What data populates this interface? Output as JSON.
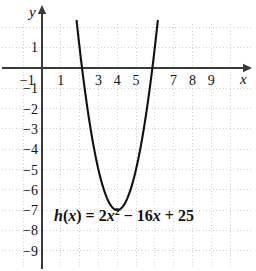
{
  "figure": {
    "background_color": "#ffffff",
    "axis_color": "#3a3a3a",
    "grid_color": "#d0d0d0",
    "curve_color": "#111111",
    "x_axis_letter": "x",
    "y_axis_letter": "y",
    "equation_parts": {
      "lhs_fn": "h",
      "lhs_open": "(",
      "lhs_var": "x",
      "lhs_close": ")",
      "equals": "=",
      "coef_a": "2",
      "var_a": "x",
      "exponent": "2",
      "minus": "−",
      "coef_b": "16",
      "var_b": "x",
      "plus": "+",
      "constant": "25"
    },
    "equation_text": "h(x) = 2x² − 16x + 25"
  },
  "chart_data": {
    "type": "line",
    "title": "",
    "subtitle": "",
    "xlabel": "x",
    "ylabel": "y",
    "annotations": [
      "h(x) = 2x² − 16x + 25"
    ],
    "function": "h(x) = 2x^2 - 16x + 25",
    "coefficients": {
      "a": 2,
      "b": -16,
      "c": 25
    },
    "vertex": {
      "x": 4,
      "y": -7
    },
    "roots": [
      2.129,
      5.871
    ],
    "y_intercept": 25,
    "grid": true,
    "legend": "none",
    "xlim": [
      -1.6,
      10.4
    ],
    "ylim": [
      -9.8,
      2.1
    ],
    "x_ticks": [
      -1,
      1,
      2,
      3,
      4,
      5,
      6,
      7,
      8,
      9
    ],
    "x_tick_labels_visible": [
      "-1",
      "1",
      "3",
      "4",
      "5",
      "7",
      "8",
      "9"
    ],
    "y_ticks": [
      1,
      -1,
      -2,
      -3,
      -4,
      -5,
      -6,
      -7,
      -8,
      -9
    ],
    "y_tick_labels_visible": [
      "1",
      "-1",
      "-2",
      "-3",
      "-4",
      "-5",
      "-6",
      "-7",
      "-8",
      "-9"
    ],
    "series": [
      {
        "name": "h(x) = 2x² − 16x + 25",
        "x": [
          2.05,
          2.2,
          2.4,
          2.6,
          2.8,
          3.0,
          3.2,
          3.4,
          3.6,
          3.8,
          4.0,
          4.2,
          4.4,
          4.6,
          4.8,
          5.0,
          5.2,
          5.4,
          5.6,
          5.8,
          6.0,
          6.2
        ],
        "values": [
          0.6,
          -0.52,
          -1.88,
          -3.08,
          -4.12,
          -5.0,
          -5.72,
          -6.28,
          -6.68,
          -6.92,
          -7.0,
          -6.92,
          -6.68,
          -6.28,
          -5.72,
          -5.0,
          -4.12,
          -3.08,
          -1.88,
          -0.52,
          1.0,
          2.28
        ]
      }
    ]
  },
  "x_tick_labels": [
    {
      "value": -1,
      "label": "−1"
    },
    {
      "value": 1,
      "label": "1"
    },
    {
      "value": 3,
      "label": "3"
    },
    {
      "value": 4,
      "label": "4"
    },
    {
      "value": 5,
      "label": "5"
    },
    {
      "value": 7,
      "label": "7"
    },
    {
      "value": 8,
      "label": "8"
    },
    {
      "value": 9,
      "label": "9"
    }
  ],
  "y_tick_labels": [
    {
      "value": 1,
      "label": "1"
    },
    {
      "value": -1,
      "label": "−1"
    },
    {
      "value": -2,
      "label": "−2"
    },
    {
      "value": -3,
      "label": "−3"
    },
    {
      "value": -4,
      "label": "−4"
    },
    {
      "value": -5,
      "label": "−5"
    },
    {
      "value": -6,
      "label": "−6"
    },
    {
      "value": -7,
      "label": "−7"
    },
    {
      "value": -8,
      "label": "−8"
    },
    {
      "value": -9,
      "label": "−9"
    }
  ]
}
